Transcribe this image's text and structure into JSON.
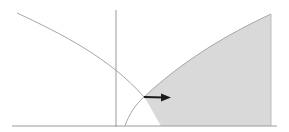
{
  "diagram": {
    "colors": {
      "background": "#ffffff",
      "shade": "#d9d9d9",
      "curve": "#a6a6a6",
      "axis": "#9a9a9a",
      "arrow": "#1a1a1a"
    }
  }
}
